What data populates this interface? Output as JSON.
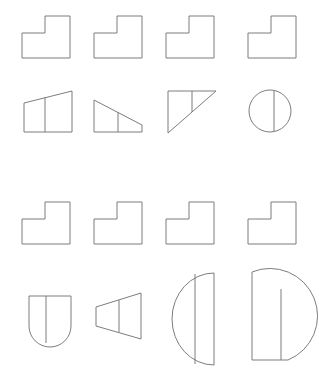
{
  "sheet": {
    "title": "Geometric figure grid",
    "background_color": "#ffffff",
    "stroke_color": "#7d7d7d",
    "stroke_width": 1,
    "width": 319,
    "height": 382,
    "columns": 4,
    "rows": 4
  },
  "rows": [
    {
      "row_index": 1,
      "row_name": "solid-row-top",
      "description": "Four identical L-shaped block outlines",
      "cells": [
        {
          "name": "l-block-r1c1",
          "shape_type": "l-block",
          "divider": "none"
        },
        {
          "name": "l-block-r1c2",
          "shape_type": "l-block",
          "divider": "none"
        },
        {
          "name": "l-block-r1c3",
          "shape_type": "l-block",
          "divider": "none"
        },
        {
          "name": "l-block-r1c4",
          "shape_type": "l-block",
          "divider": "none"
        }
      ]
    },
    {
      "row_index": 2,
      "row_name": "section-row-top",
      "description": "Four cross-section candidates: slanted-top trapezoid, right trapezoid, flat-top right triangle, circle",
      "cells": [
        {
          "name": "slanted-top-trapezoid",
          "shape_type": "trapezoid",
          "divider": "vertical"
        },
        {
          "name": "right-trapezoid",
          "shape_type": "right-trapezoid",
          "divider": "vertical"
        },
        {
          "name": "flat-top-right-triangle",
          "shape_type": "right-triangle",
          "divider": "vertical"
        },
        {
          "name": "divided-circle",
          "shape_type": "circle",
          "divider": "vertical"
        }
      ]
    },
    {
      "row_index": 3,
      "row_name": "solid-row-bottom",
      "description": "Four identical L-shaped block outlines",
      "cells": [
        {
          "name": "l-block-r3c1",
          "shape_type": "l-block",
          "divider": "none"
        },
        {
          "name": "l-block-r3c2",
          "shape_type": "l-block",
          "divider": "none"
        },
        {
          "name": "l-block-r3c3",
          "shape_type": "l-block",
          "divider": "none"
        },
        {
          "name": "l-block-r3c4",
          "shape_type": "l-block",
          "divider": "none"
        }
      ]
    },
    {
      "row_index": 4,
      "row_name": "section-row-bottom",
      "description": "Four cross-section candidates: round-bottom U shape, flared trapezoid, half-disc, teardrop",
      "cells": [
        {
          "name": "round-bottom-u-shape",
          "shape_type": "u-shape",
          "divider": "vertical"
        },
        {
          "name": "flared-trapezoid",
          "shape_type": "trapezoid",
          "divider": "vertical"
        },
        {
          "name": "half-disc",
          "shape_type": "semicircle",
          "divider": "vertical"
        },
        {
          "name": "teardrop",
          "shape_type": "teardrop",
          "divider": "vertical"
        }
      ]
    }
  ]
}
